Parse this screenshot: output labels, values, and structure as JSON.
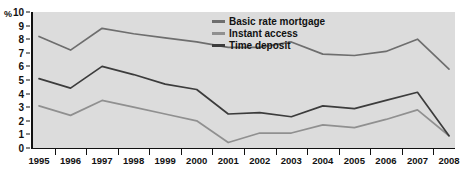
{
  "chart_data": {
    "type": "line",
    "title": "",
    "xlabel": "",
    "ylabel": "%",
    "unit_label": "%",
    "categories": [
      "1995",
      "1996",
      "1997",
      "1998",
      "1999",
      "2000",
      "2001",
      "2002",
      "2003",
      "2004",
      "2005",
      "2006",
      "2007",
      "2008"
    ],
    "x": [
      1995,
      1996,
      1997,
      1998,
      1999,
      2000,
      2001,
      2002,
      2003,
      2004,
      2005,
      2006,
      2007,
      2008
    ],
    "ylim": [
      0,
      10
    ],
    "xlim": [
      1995,
      2008
    ],
    "y_ticks": [
      0,
      1,
      2,
      3,
      4,
      5,
      6,
      7,
      8,
      9,
      10
    ],
    "grid": false,
    "legend_position": "top-right",
    "plot_background": "#dcdcdc",
    "page_background": "#ffffff",
    "axis_color": "#111111",
    "series": [
      {
        "name": "Basic rate mortgage",
        "color": "#6e6e6e",
        "values": [
          8.2,
          7.2,
          8.8,
          8.4,
          8.1,
          7.8,
          7.4,
          7.4,
          7.8,
          6.9,
          6.8,
          7.1,
          8.0,
          5.8
        ]
      },
      {
        "name": "Instant access",
        "color": "#909090",
        "values": [
          3.1,
          2.4,
          3.5,
          3.0,
          2.5,
          2.0,
          0.4,
          1.1,
          1.1,
          1.7,
          1.5,
          2.1,
          2.8,
          0.9
        ]
      },
      {
        "name": "Time deposit",
        "color": "#3c3c3c",
        "values": [
          5.1,
          4.4,
          6.0,
          5.4,
          4.7,
          4.3,
          2.5,
          2.6,
          2.3,
          3.1,
          2.9,
          3.5,
          4.1,
          0.9
        ]
      }
    ]
  },
  "legend": {
    "items": [
      {
        "label": "Basic rate mortgage",
        "color": "#6e6e6e"
      },
      {
        "label": "Instant access",
        "color": "#909090"
      },
      {
        "label": "Time deposit",
        "color": "#3c3c3c"
      }
    ]
  }
}
